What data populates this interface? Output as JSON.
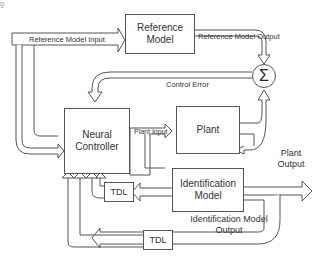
{
  "figure_fragment": "g.",
  "blocks": {
    "reference_model": "Reference Model",
    "neural_controller": "Neural Controller",
    "plant": "Plant",
    "identification_model": "Identification Model",
    "tdl_top": "TDL",
    "tdl_bottom": "TDL",
    "summing_junction": "Σ"
  },
  "signals": {
    "reference_model_input": "Reference Model Input",
    "reference_model_output": "Reference Model Output",
    "control_error": "Control Error",
    "plant_input": "Plant Input",
    "plant_output": "Plant Output",
    "identification_model_output": "Identification Model Output"
  },
  "colors": {
    "stroke": "#555555",
    "text": "#333333",
    "background": "#ffffff"
  }
}
